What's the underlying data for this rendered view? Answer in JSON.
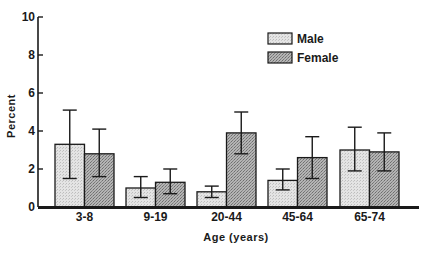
{
  "chart_data": {
    "type": "bar",
    "title": "",
    "xlabel": "Age (years)",
    "ylabel": "Percent",
    "ylim": [
      0,
      10
    ],
    "yticks": [
      0,
      2,
      4,
      6,
      8,
      10
    ],
    "grid": false,
    "legend_position": "upper right",
    "categories": [
      "3-8",
      "9-19",
      "20-44",
      "45-64",
      "65-74"
    ],
    "series": [
      {
        "name": "Male",
        "color": "#dcdcdc",
        "values": [
          3.3,
          1.0,
          0.8,
          1.4,
          3.0
        ],
        "error_low": [
          1.5,
          0.5,
          0.5,
          0.9,
          1.9
        ],
        "error_high": [
          5.1,
          1.6,
          1.1,
          2.0,
          4.2
        ]
      },
      {
        "name": "Female",
        "color": "#a4a4a4",
        "values": [
          2.8,
          1.3,
          3.9,
          2.6,
          2.9
        ],
        "error_low": [
          1.6,
          0.7,
          2.8,
          1.5,
          1.9
        ],
        "error_high": [
          4.1,
          2.0,
          5.0,
          3.7,
          3.9
        ]
      }
    ]
  }
}
